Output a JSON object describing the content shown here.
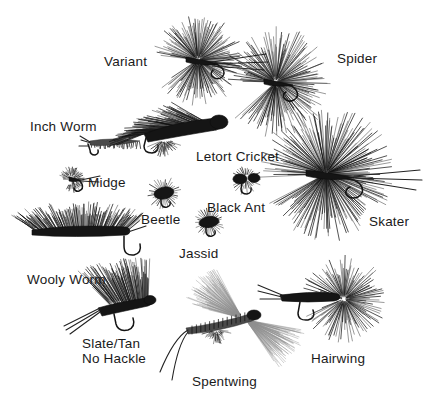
{
  "page": {
    "background_color": "#ffffff",
    "ink_color": "#1a1a1a",
    "width": 429,
    "height": 413
  },
  "labels": [
    {
      "id": "variant",
      "text": "Variant",
      "x": 104,
      "y": 54,
      "align": "left"
    },
    {
      "id": "spider",
      "text": "Spider",
      "x": 337,
      "y": 51,
      "align": "left"
    },
    {
      "id": "inch-worm",
      "text": "Inch Worm",
      "x": 30,
      "y": 119,
      "align": "left"
    },
    {
      "id": "letort-cricket",
      "text": "Letort Cricket",
      "x": 196,
      "y": 149,
      "align": "left"
    },
    {
      "id": "midge",
      "text": "Midge",
      "x": 88,
      "y": 175,
      "align": "left"
    },
    {
      "id": "black-ant",
      "text": "Black Ant",
      "x": 207,
      "y": 200,
      "align": "left"
    },
    {
      "id": "beetle",
      "text": "Beetle",
      "x": 141,
      "y": 212,
      "align": "left"
    },
    {
      "id": "skater",
      "text": "Skater",
      "x": 369,
      "y": 214,
      "align": "left"
    },
    {
      "id": "jassid",
      "text": "Jassid",
      "x": 179,
      "y": 246,
      "align": "left"
    },
    {
      "id": "wooly-worm",
      "text": "Wooly Worm",
      "x": 27,
      "y": 272,
      "align": "left"
    },
    {
      "id": "slate-tan-no-hackle",
      "text": "Slate/Tan\nNo Hackle",
      "x": 82,
      "y": 336,
      "align": "left"
    },
    {
      "id": "hairwing",
      "text": "Hairwing",
      "x": 311,
      "y": 351,
      "align": "left"
    },
    {
      "id": "spentwing",
      "text": "Spentwing",
      "x": 192,
      "y": 374,
      "align": "left"
    }
  ],
  "flies": [
    {
      "id": "variant",
      "name": "Variant fly",
      "x": 152,
      "y": 10,
      "w": 120,
      "h": 105
    },
    {
      "id": "spider",
      "name": "Spider fly",
      "x": 248,
      "y": 14,
      "w": 110,
      "h": 110
    },
    {
      "id": "inch-worm",
      "name": "Inch Worm fly",
      "x": 78,
      "y": 130,
      "w": 72,
      "h": 30
    },
    {
      "id": "letort-cricket",
      "name": "Letort Cricket fly",
      "x": 124,
      "y": 98,
      "w": 116,
      "h": 62
    },
    {
      "id": "skater",
      "name": "Skater fly",
      "x": 282,
      "y": 108,
      "w": 142,
      "h": 125
    },
    {
      "id": "midge",
      "name": "Midge fly",
      "x": 58,
      "y": 164,
      "w": 44,
      "h": 30
    },
    {
      "id": "beetle",
      "name": "Beetle fly",
      "x": 144,
      "y": 178,
      "w": 42,
      "h": 32
    },
    {
      "id": "black-ant",
      "name": "Black Ant fly",
      "x": 228,
      "y": 166,
      "w": 42,
      "h": 30
    },
    {
      "id": "jassid",
      "name": "Jassid fly",
      "x": 190,
      "y": 208,
      "w": 40,
      "h": 30
    },
    {
      "id": "wooly-worm",
      "name": "Wooly Worm fly",
      "x": 24,
      "y": 196,
      "w": 126,
      "h": 72
    },
    {
      "id": "slate-tan",
      "name": "Slate/Tan No Hackle fly",
      "x": 62,
      "y": 246,
      "w": 120,
      "h": 96
    },
    {
      "id": "spentwing",
      "name": "Spentwing fly",
      "x": 156,
      "y": 252,
      "w": 160,
      "h": 130
    },
    {
      "id": "hairwing",
      "name": "Hairwing fly",
      "x": 258,
      "y": 255,
      "w": 140,
      "h": 96
    }
  ]
}
